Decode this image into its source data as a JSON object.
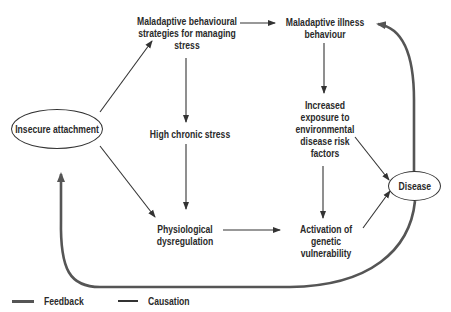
{
  "diagram": {
    "nodes": {
      "insecure_attachment": "Insecure attachment",
      "maladaptive_strategies": "Maladaptive behavioural\nstrategies for managing\nstress",
      "maladaptive_illness": "Maladaptive illness\nbehaviour",
      "high_chronic_stress": "High chronic stress",
      "increased_exposure": "Increased\nexposure to\nenvironmental\ndisease risk\nfactors",
      "physiological_dysregulation": "Physiological\ndysregulation",
      "activation_genetic": "Activation of\ngenetic vulnerability",
      "disease": "Disease"
    },
    "edges": [
      {
        "from": "insecure_attachment",
        "to": "maladaptive_strategies",
        "type": "causation"
      },
      {
        "from": "insecure_attachment",
        "to": "physiological_dysregulation",
        "type": "causation"
      },
      {
        "from": "maladaptive_strategies",
        "to": "maladaptive_illness",
        "type": "causation"
      },
      {
        "from": "maladaptive_strategies",
        "to": "high_chronic_stress",
        "type": "causation"
      },
      {
        "from": "high_chronic_stress",
        "to": "physiological_dysregulation",
        "type": "causation"
      },
      {
        "from": "maladaptive_illness",
        "to": "increased_exposure",
        "type": "causation"
      },
      {
        "from": "physiological_dysregulation",
        "to": "activation_genetic",
        "type": "causation"
      },
      {
        "from": "increased_exposure",
        "to": "activation_genetic",
        "type": "causation"
      },
      {
        "from": "increased_exposure",
        "to": "disease",
        "type": "causation"
      },
      {
        "from": "activation_genetic",
        "to": "disease",
        "type": "causation"
      },
      {
        "from": "disease",
        "to": "maladaptive_illness",
        "type": "feedback"
      },
      {
        "from": "disease",
        "to": "insecure_attachment",
        "type": "feedback"
      }
    ],
    "legend": {
      "feedback": "Feedback",
      "causation": "Causation"
    },
    "colors": {
      "text": "#2a2a2a",
      "causation_line": "#333333",
      "feedback_line": "#555555"
    }
  }
}
